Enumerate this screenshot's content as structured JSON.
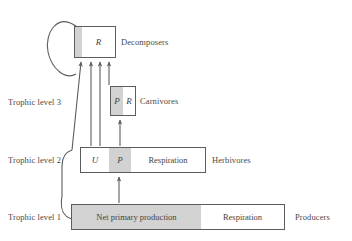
{
  "figure": {
    "background_color": "#ffffff",
    "line_color": "#5d5d5d",
    "text_color": "#4a4a4a",
    "gray_fill": "#d2d2d2",
    "white_fill": "#ffffff"
  },
  "trophic_levels": [
    {
      "id": "level3",
      "label": "Trophic level 3"
    },
    {
      "id": "level2",
      "label": "Trophic level 2"
    },
    {
      "id": "level1",
      "label": "Trophic level 1"
    }
  ],
  "boxes": {
    "decomposers": {
      "group_label": "Decomposers",
      "segments": [
        {
          "name": "unlabeled-gray-strip",
          "label": "",
          "fill": "gray"
        },
        {
          "name": "respiration",
          "label": "R",
          "fill": "white",
          "italic": true
        }
      ]
    },
    "carnivores": {
      "group_label": "Carnivores",
      "segments": [
        {
          "name": "production",
          "label": "P",
          "fill": "gray",
          "italic": true
        },
        {
          "name": "respiration",
          "label": "R",
          "fill": "white",
          "italic": true
        }
      ]
    },
    "herbivores": {
      "group_label": "Herbivores",
      "segments": [
        {
          "name": "unassimilated",
          "label": "U",
          "fill": "white",
          "italic": true
        },
        {
          "name": "production",
          "label": "P",
          "fill": "gray",
          "italic": true
        },
        {
          "name": "respiration",
          "label": "Respiration",
          "fill": "white",
          "italic": false
        }
      ]
    },
    "producers": {
      "group_label": "Producers",
      "segments": [
        {
          "name": "net-primary-production",
          "label": "Net primary production",
          "fill": "gray",
          "italic": false
        },
        {
          "name": "respiration",
          "label": "Respiration",
          "fill": "white",
          "italic": false
        }
      ]
    }
  },
  "flows": [
    {
      "name": "producers-to-herbivores",
      "from": "producers",
      "to": "herbivores",
      "style": "straight-arrow"
    },
    {
      "name": "herbivores-to-carnivores",
      "from": "herbivores",
      "to": "carnivores",
      "style": "straight-arrow"
    },
    {
      "name": "carnivores-to-decomposers",
      "from": "carnivores",
      "to": "decomposers",
      "style": "straight-arrow"
    },
    {
      "name": "herbivores-to-decomposers",
      "from": "herbivores",
      "to": "decomposers",
      "style": "straight-arrow"
    },
    {
      "name": "producers-to-decomposers",
      "from": "producers",
      "to": "decomposers",
      "style": "diagonal-arrow"
    },
    {
      "name": "decomposers-self-loop",
      "from": "decomposers",
      "to": "decomposers",
      "style": "loop-arrow"
    }
  ]
}
